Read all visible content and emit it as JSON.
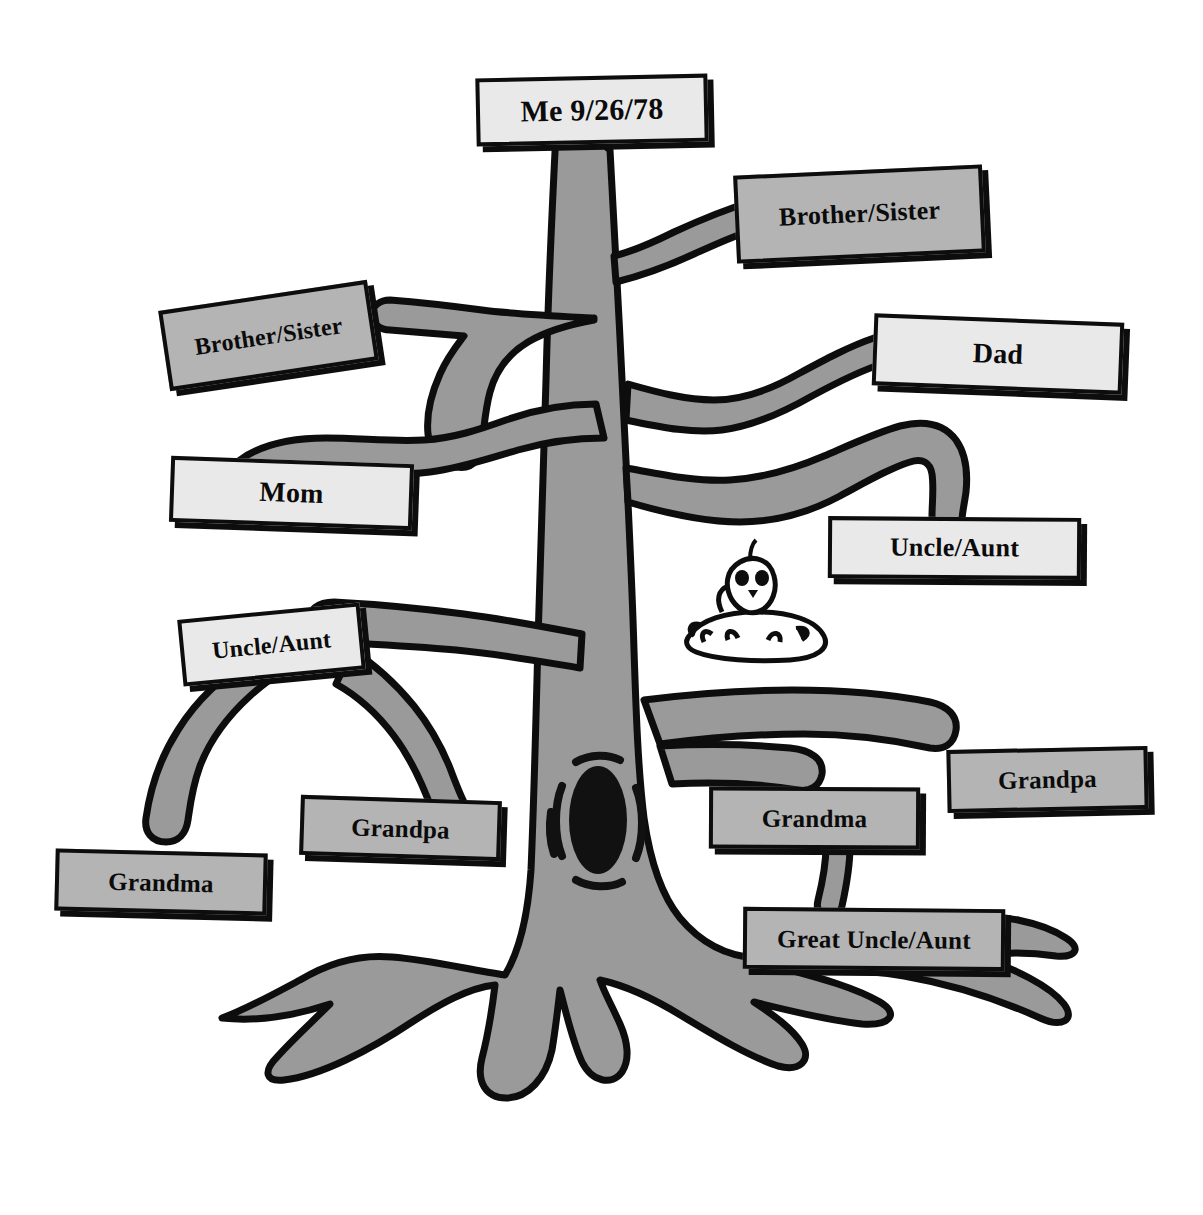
{
  "diagram": {
    "colors": {
      "tree_fill": "#9a9a9a",
      "outline": "#0d0d0d",
      "label_light": "#e9e9e9",
      "label_gray": "#b4b4b4",
      "background": "#ffffff",
      "knot_fill": "#111111"
    },
    "decorations": [
      {
        "name": "bird-in-nest",
        "description": "cartoon bird sitting in nest"
      },
      {
        "name": "tree-knot-hole",
        "description": "dark oval knot hole on trunk"
      }
    ]
  },
  "labels": [
    {
      "id": "me",
      "text": "Me 9/26/78",
      "shade": "light",
      "x": 476,
      "y": 76,
      "w": 232,
      "h": 68,
      "rot": -1.2,
      "font": 30
    },
    {
      "id": "brother-sister-right",
      "text": "Brother/Sister",
      "shade": "gray",
      "x": 735,
      "y": 170,
      "w": 249,
      "h": 88,
      "rot": -2.6,
      "font": 26
    },
    {
      "id": "brother-sister-left",
      "text": "Brother/Sister",
      "shade": "gray",
      "x": 163,
      "y": 295,
      "w": 211,
      "h": 81,
      "rot": -8.5,
      "font": 24
    },
    {
      "id": "dad",
      "text": "Dad",
      "shade": "light",
      "x": 873,
      "y": 318,
      "w": 250,
      "h": 72,
      "rot": 2.2,
      "font": 28
    },
    {
      "id": "mom",
      "text": "Mom",
      "shade": "light",
      "x": 170,
      "y": 460,
      "w": 243,
      "h": 66,
      "rot": 2.0,
      "font": 28
    },
    {
      "id": "uncle-aunt-right",
      "text": "Uncle/Aunt",
      "shade": "light",
      "x": 828,
      "y": 517,
      "w": 253,
      "h": 62,
      "rot": 0.4,
      "font": 26
    },
    {
      "id": "uncle-aunt-left",
      "text": "Uncle/Aunt",
      "shade": "light",
      "x": 180,
      "y": 611,
      "w": 183,
      "h": 67,
      "rot": -5.5,
      "font": 24
    },
    {
      "id": "grandpa-right",
      "text": "Grandpa",
      "shade": "gray",
      "x": 947,
      "y": 748,
      "w": 201,
      "h": 63,
      "rot": -1.2,
      "font": 25
    },
    {
      "id": "grandma-right",
      "text": "Grandma",
      "shade": "gray",
      "x": 709,
      "y": 787,
      "w": 211,
      "h": 62,
      "rot": 0.3,
      "font": 25
    },
    {
      "id": "grandpa-left",
      "text": "Grandpa",
      "shade": "gray",
      "x": 300,
      "y": 798,
      "w": 201,
      "h": 60,
      "rot": 1.8,
      "font": 25
    },
    {
      "id": "grandma-left",
      "text": "Grandma",
      "shade": "gray",
      "x": 55,
      "y": 851,
      "w": 212,
      "h": 62,
      "rot": 1.4,
      "font": 25
    },
    {
      "id": "great-uncle-aunt",
      "text": "Great Uncle/Aunt",
      "shade": "gray",
      "x": 743,
      "y": 908,
      "w": 262,
      "h": 62,
      "rot": 0.5,
      "font": 25
    }
  ]
}
